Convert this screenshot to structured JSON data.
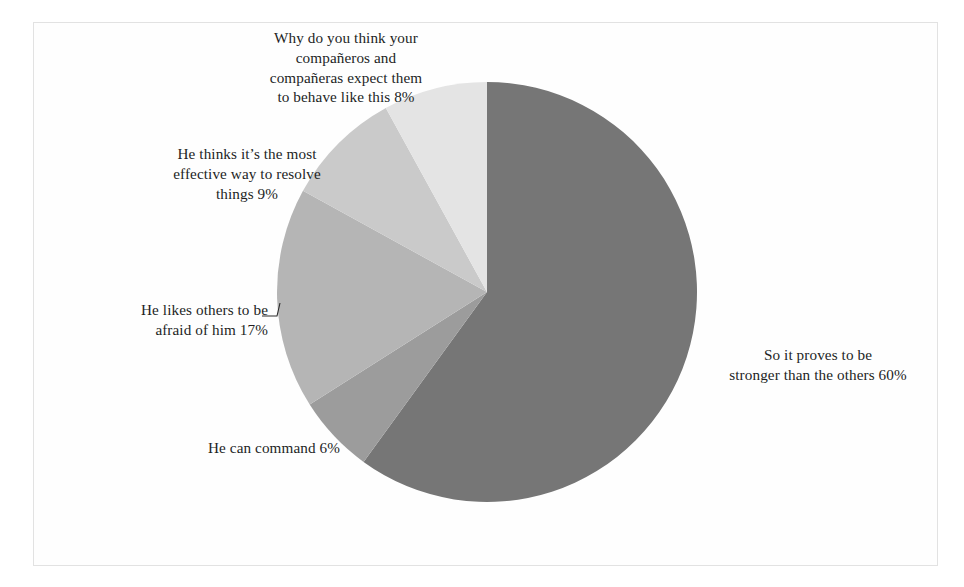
{
  "figure": {
    "background_color": "#ffffff",
    "frame_color": "#e2e2e2",
    "text_color": "#231f1f"
  },
  "chart_data": {
    "type": "pie",
    "title": "",
    "subtitle": "",
    "xlabel": "",
    "ylabel": "",
    "legend_position": "none",
    "grid": false,
    "labels_show_percent": true,
    "start_angle_deg": 0,
    "direction": "clockwise",
    "center": {
      "x": 487,
      "y": 292
    },
    "radius": 210,
    "categories": [
      "So it proves to be stronger than the others",
      "He can command",
      "He likes others to be afraid of him",
      "He thinks it’s the most effective way to resolve things",
      "Why do you think your compañeros and compañeras expect them to behave like this"
    ],
    "values": [
      60,
      6,
      17,
      9,
      8
    ],
    "unit": "%",
    "slices": [
      {
        "label": "So it proves to be stronger than the others",
        "value": 60,
        "value_text": "60%",
        "color": "#767676",
        "start_deg": 0,
        "end_deg": 216
      },
      {
        "label": "He can command",
        "value": 6,
        "value_text": "6%",
        "color": "#9c9c9c",
        "start_deg": 216,
        "end_deg": 237.6
      },
      {
        "label": "He likes others to be afraid of him",
        "value": 17,
        "value_text": "17%",
        "color": "#b5b5b5",
        "start_deg": 237.6,
        "end_deg": 298.8
      },
      {
        "label": "He thinks it’s the most effective way to resolve things",
        "value": 9,
        "value_text": "9%",
        "color": "#cacaca",
        "start_deg": 298.8,
        "end_deg": 331.2
      },
      {
        "label": "Why do you think your compañeros and compañeras expect them to behave like this",
        "value": 8,
        "value_text": "8%",
        "color": "#e4e4e4",
        "start_deg": 331.2,
        "end_deg": 360
      }
    ],
    "annotations": [
      {
        "name": "leader-line-afraid",
        "from": {
          "x": 262,
          "y": 316
        },
        "elbow": {
          "x": 277,
          "y": 316
        },
        "to": {
          "x": 280,
          "y": 303
        }
      }
    ]
  },
  "labels": {
    "why": "Why do you think your\ncompañeros and\ncompañeras expect them\nto behave like this 8%",
    "effective": "He thinks it’s the most\neffective way to resolve\nthings 9%",
    "afraid": "He likes others to be\nafraid of him 17%",
    "command": "He can command 6%",
    "stronger": "So it proves to be\nstronger than the others 60%"
  }
}
